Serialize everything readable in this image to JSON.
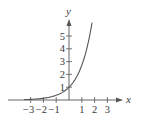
{
  "chart_data": {
    "type": "line",
    "title": "",
    "function": "y = e^x",
    "xlabel": "x",
    "ylabel": "y",
    "xlim": [
      -3.5,
      3.2
    ],
    "ylim": [
      0,
      6
    ],
    "grid": false,
    "legend": null,
    "x_ticks": [
      -3,
      -2,
      -1,
      1,
      2,
      3
    ],
    "x_tick_labels": [
      "−3",
      "−2",
      "−1",
      "1",
      "2",
      "3"
    ],
    "y_ticks": [
      1,
      2,
      3,
      4,
      5
    ],
    "y_tick_labels": [
      "1",
      "2",
      "3",
      "4",
      "5"
    ],
    "series": [
      {
        "name": "e^x",
        "x": [
          -3.5,
          -3,
          -2.5,
          -2,
          -1.5,
          -1,
          -0.5,
          0,
          0.5,
          1,
          1.25,
          1.5,
          1.75,
          1.8
        ],
        "values": [
          0.03,
          0.05,
          0.08,
          0.14,
          0.22,
          0.37,
          0.61,
          1.0,
          1.65,
          2.72,
          3.49,
          4.48,
          5.75,
          6.05
        ],
        "color": "#555555"
      }
    ]
  },
  "colors": {
    "axis": "#555555",
    "curve": "#555555",
    "text": "#3a3a3a"
  }
}
